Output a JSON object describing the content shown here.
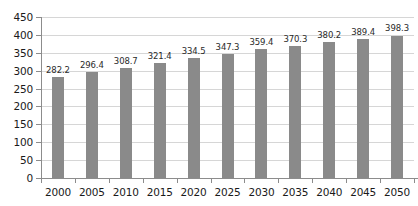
{
  "chart_data": {
    "type": "bar",
    "title": "",
    "subtitle": "",
    "xlabel": "",
    "ylabel": "",
    "categories": [
      "2000",
      "2005",
      "2010",
      "2015",
      "2020",
      "2025",
      "2030",
      "2035",
      "2040",
      "2045",
      "2050"
    ],
    "values": [
      282.2,
      296.4,
      308.7,
      321.4,
      334.5,
      347.3,
      359.4,
      370.3,
      380.2,
      389.4,
      398.3
    ],
    "value_labels": [
      "282.2",
      "296.4",
      "308.7",
      "321.4",
      "334.5",
      "347.3",
      "359.4",
      "370.3",
      "380.2",
      "389.4",
      "398.3"
    ],
    "ylim": [
      0,
      450
    ],
    "ytick_values": [
      0,
      50,
      100,
      150,
      200,
      250,
      300,
      350,
      400,
      450
    ],
    "ytick_labels": [
      "0",
      "50",
      "100",
      "150",
      "200",
      "250",
      "300",
      "350",
      "400",
      "450"
    ],
    "grid": true,
    "legend": false,
    "legend_position": "none",
    "series": [
      {
        "name": "",
        "values": [
          282.2,
          296.4,
          308.7,
          321.4,
          334.5,
          347.3,
          359.4,
          370.3,
          380.2,
          389.4,
          398.3
        ]
      }
    ]
  },
  "style": {
    "bar_color": "#8a8a8a",
    "grid_color": "#d6d6d6",
    "axis_color": "#8c8c8c",
    "text_color": "#1a1a1a",
    "label_color": "#2a2a2a",
    "background": "#ffffff"
  }
}
